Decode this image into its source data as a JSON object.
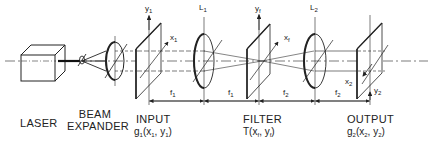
{
  "diagram": {
    "type": "optical-4f-system",
    "components": [
      {
        "id": "laser",
        "label": "LASER"
      },
      {
        "id": "beam_expander",
        "label_line1": "BEAM",
        "label_line2": "EXPANDER"
      },
      {
        "id": "input",
        "label": "INPUT",
        "function": "g",
        "function_sub": "1",
        "args": "(x",
        "arg1_sub": "1",
        "sep": ", y",
        "arg2_sub": "1",
        "close": ")",
        "axis_y": "y",
        "axis_y_sub": "1",
        "axis_x": "x",
        "axis_x_sub": "1"
      },
      {
        "id": "lens1",
        "label": "L",
        "label_sub": "1"
      },
      {
        "id": "filter",
        "label": "FILTER",
        "function": "T",
        "args": "(x",
        "arg1_sub": "f",
        "sep": ", y",
        "arg2_sub": "f",
        "close": ")",
        "axis_y": "y",
        "axis_y_sub": "f",
        "axis_x": "x",
        "axis_x_sub": "f"
      },
      {
        "id": "lens2",
        "label": "L",
        "label_sub": "2"
      },
      {
        "id": "output",
        "label": "OUTPUT",
        "function": "g",
        "function_sub": "2",
        "args": "(x",
        "arg1_sub": "2",
        "sep": ", y",
        "arg2_sub": "2",
        "close": ")",
        "axis_y": "y",
        "axis_y_sub": "2",
        "axis_x": "x",
        "axis_x_sub": "2"
      }
    ],
    "distances": [
      {
        "label": "f",
        "sub": "1"
      },
      {
        "label": "f",
        "sub": "1"
      },
      {
        "label": "f",
        "sub": "2"
      },
      {
        "label": "f",
        "sub": "2"
      }
    ]
  }
}
